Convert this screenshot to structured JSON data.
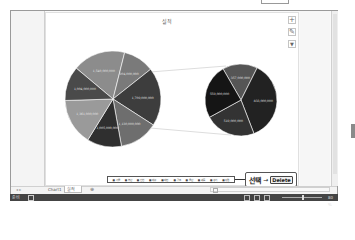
{
  "chart": {
    "title": "실적",
    "buttons": [
      {
        "name": "chart-elements-button",
        "glyph": "+"
      },
      {
        "name": "chart-styles-button",
        "glyph": "✎"
      },
      {
        "name": "chart-filters-button",
        "glyph": "▼"
      }
    ],
    "legend_items": [
      "■ 서울",
      "■ 부산",
      "■ 인천",
      "■ 대구",
      "■ 대전",
      "■ 광주",
      "■ 울산",
      "■ 세종",
      "■ 경기",
      "■ 강원"
    ]
  },
  "chart_data": {
    "type": "pie",
    "subtype": "pie-of-pie",
    "title": "실적",
    "primary_pie": {
      "labels_shown": [
        "1,540,000,000",
        "904,000,000",
        "1,709,000,000",
        "1,130,000,000",
        "1,005,000,000",
        "1,361,000,000",
        "1,004,000,000"
      ],
      "values": [
        1540000000,
        904000000,
        1709000000,
        1130000000,
        1005000000,
        1361000000,
        1004000000
      ],
      "colors": [
        "#8c8c8c",
        "#7a7a7a",
        "#3d3d3d",
        "#6e6e6e",
        "#2f2f2f",
        "#9a9a9a",
        "#4a4a4a"
      ]
    },
    "secondary_pie": {
      "labels_shown": [
        "357,000,000",
        "833,000,000",
        "519,000,000",
        "559,000,000"
      ],
      "values": [
        357000000,
        833000000,
        519000000,
        559000000
      ],
      "colors": [
        "#555555",
        "#222222",
        "#333333",
        "#151515"
      ]
    },
    "legend_position": "bottom"
  },
  "callout": {
    "select_label": "선택",
    "arrow": "→",
    "key_label": "Delete"
  },
  "sheets": {
    "nav": "◂ ▸",
    "tabs": [
      "Chart1",
      "실적"
    ],
    "active": "실적",
    "add": "⊕"
  },
  "status": {
    "ready": "준비",
    "zoom": "80 %"
  }
}
